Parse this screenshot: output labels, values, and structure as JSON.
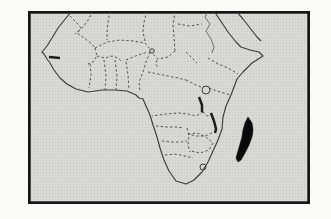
{
  "figure": {
    "type": "map",
    "region": "Africa",
    "highlighted_region": "Madagascar",
    "canvas": {
      "width": 331,
      "height": 219,
      "page_background": "#fbfbf9"
    },
    "frame": {
      "x": 28,
      "y": 11,
      "width": 282,
      "height": 193,
      "border_color": "#161616",
      "border_width": 2.7,
      "fill": "#d8d8d6",
      "halftone_dot": "#c2c2c0"
    },
    "styles": {
      "coast": {
        "stroke": "#3c3c3c",
        "width": 1.15,
        "fill": "none"
      },
      "border": {
        "stroke": "#4c4c4c",
        "width": 0.95,
        "dash": "2.4 2.3",
        "fill": "none"
      },
      "river": {
        "stroke": "#565656",
        "width": 0.8,
        "fill": "none"
      },
      "lake_line": {
        "stroke": "#1d1d1d",
        "width": 2.5,
        "fill": "none"
      },
      "lake_outline": {
        "stroke": "#3c3c3c",
        "width": 1.0,
        "fill": "none"
      },
      "highlight": {
        "stroke": "#0a0a0a",
        "width": 0.6,
        "fill": "#0a0a0a"
      }
    },
    "layers": [
      {
        "name": "africa-coastline",
        "kind": "path",
        "style": "coast",
        "d": "M72,11 L66,18 L58,28 L52,38 L47,46 L42,52 L44,54 L47,59 L50,63 L54,70 L60,78 L67,84 L76,89 L88,92 L102,90 L115,90 L127,91 L136,95 L139,98 L143,99 L146,106 L150,115 L153,125 L157,137 L160,148 L164,160 L169,171 L176,181 L186,184 L194,180 L202,172 L208,162 L213,151 L218,140 L222,129 L223,117 L226,106 L231,95 L234,87 L237,79 L243,72 L252,63 L263,56 L259,52 L250,50 L241,47 L236,42 L228,32 L220,20 L214,11"
      },
      {
        "name": "arabian-coastline",
        "kind": "path",
        "style": "coast",
        "d": "M236,11 L243,19 L250,28 L257,37 L261,41"
      },
      {
        "name": "nile-river",
        "kind": "path",
        "style": "river",
        "d": "M208,11 L205,17 L210,24 L206,31 L211,39 L214,47 L212,53"
      },
      {
        "name": "borders-northwest",
        "kind": "path",
        "style": "border",
        "d": "M70,16 L76,22 L81,28 L77,33 L84,38 L92,44 L95,48 M93,11 L87,22 L80,30 L75,34 M110,11 L108,22 L107,32 L107,40 M147,11 L144,22 L143,32 L145,41 M175,11 L173,25 L174,38 L175,51"
      },
      {
        "name": "borders-sahel-west-africa",
        "kind": "path",
        "style": "border",
        "d": "M95,48 L107,42 L120,40 L133,41 L145,43 L150,49 M95,48 L97,56 L93,62 L88,64 M97,56 L105,58 L112,56 L118,58 L122,62 M90,64 L91,75 L89,88 M104,60 L106,76 L105,90 M115,60 L117,76 L116,90 M126,62 L128,75 L129,90 M126,60 L138,55 L148,52 M150,52 L146,62 L143,72 L139,82 L140,92"
      },
      {
        "name": "borders-central-east",
        "kind": "path",
        "style": "border",
        "d": "M175,51 L168,57 L158,59 L152,53 M157,60 L156,64 L158,68 M148,72 L158,74 L168,76 L178,78 L186,80 M186,80 L194,84 L201,87 M178,24 L190,26 L202,24 M186,52 L192,58 L197,63 M208,58 L218,64 L228,68 L238,74 M209,88 L220,92 L231,95"
      },
      {
        "name": "borders-southern",
        "kind": "path",
        "style": "border",
        "d": "M203,112 L196,116 L188,114 L178,113 L166,114 L152,116 M203,112 L207,116 L211,115 M156,126 L166,127 L176,127 L184,128 M162,141 L172,142 L181,142 L187,141 M187,128 L189,136 L188,145 L190,152 M188,134 L197,133 L206,137 L213,143 M213,143 L209,150 L200,153 L191,151 M165,155 L175,154 L185,156 L193,158 M212,133 L205,136 L196,136 L188,134"
      },
      {
        "name": "gambia-mark",
        "kind": "path",
        "style": "lake_line",
        "d": "M49,57 L60,58"
      },
      {
        "name": "lake-chad",
        "kind": "circle",
        "style": "lake_outline",
        "cx": 152,
        "cy": 51,
        "r": 2.2
      },
      {
        "name": "lake-victoria",
        "kind": "circle",
        "style": "lake_outline",
        "cx": 206,
        "cy": 90,
        "r": 4
      },
      {
        "name": "lake-tanganyika",
        "kind": "path",
        "style": "lake_line",
        "d": "M199,97 L202,105 L202,112"
      },
      {
        "name": "lake-malawi",
        "kind": "path",
        "style": "lake_line",
        "d": "M211,113 L214,121 L216,129 L215,133"
      },
      {
        "name": "lesotho-border",
        "kind": "circle",
        "style": "lake_outline",
        "cx": 203,
        "cy": 167,
        "r": 3
      },
      {
        "name": "madagascar-highlight",
        "kind": "path",
        "style": "highlight",
        "d": "M248,117 L252,123 L253,130 L252,137 L249,145 L245,153 L241,160 L238,162 L236,158 L238,151 L240,144 L242,137 L243,130 L245,123 Z"
      }
    ]
  }
}
